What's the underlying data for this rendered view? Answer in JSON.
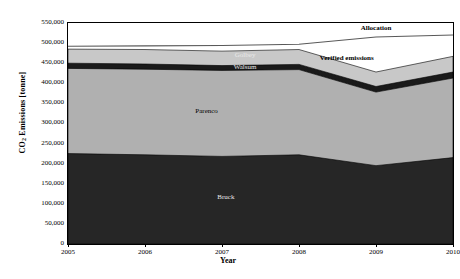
{
  "chart_data": {
    "type": "area",
    "title": "",
    "xlabel": "Year",
    "ylabel": "CO2 Emissions [tonne]",
    "ylabel_parts": {
      "pre": "CO",
      "sub": "2",
      "post": " Emissions [tonne]"
    },
    "x": [
      2005,
      2006,
      2007,
      2008,
      2009,
      2010
    ],
    "xtick_labels": [
      "2005",
      "2006",
      "2007",
      "2008",
      "2009",
      "2010"
    ],
    "xlim": [
      2005,
      2010
    ],
    "ylim": [
      0,
      550000
    ],
    "ytick_values": [
      0,
      50000,
      100000,
      150000,
      200000,
      250000,
      300000,
      350000,
      400000,
      450000,
      500000,
      550000
    ],
    "ytick_labels": [
      "0",
      "50,000",
      "100,000",
      "150,000",
      "200,000",
      "250,000",
      "300,000",
      "350,000",
      "400,000",
      "450,000",
      "500,000",
      "550,000"
    ],
    "grid": false,
    "stacked": true,
    "series": [
      {
        "name": "Bruck",
        "label": "Bruck",
        "color": "#262626",
        "values": [
          225000,
          222000,
          218000,
          222000,
          195000,
          215000
        ]
      },
      {
        "name": "Parenco",
        "label": "Parenco",
        "color": "#b0b0b0",
        "values": [
          212000,
          213000,
          214000,
          212000,
          183000,
          198000
        ]
      },
      {
        "name": "Walsum",
        "label": "Walsum",
        "color": "#1a1a1a",
        "values": [
          13000,
          13000,
          12000,
          13000,
          14000,
          15000
        ]
      },
      {
        "name": "Golbey",
        "label": "Golbey",
        "color": "#c8c8c8",
        "values": [
          35000,
          36000,
          36000,
          37000,
          36000,
          39000
        ]
      }
    ],
    "cumulative_tops": {
      "Bruck": [
        225000,
        222000,
        218000,
        222000,
        195000,
        215000
      ],
      "Parenco": [
        437000,
        435000,
        432000,
        434000,
        378000,
        413000
      ],
      "Walsum": [
        450000,
        448000,
        444000,
        447000,
        392000,
        428000
      ],
      "Golbey": [
        485000,
        484000,
        480000,
        484000,
        428000,
        467000
      ]
    },
    "lines": [
      {
        "name": "Allocation",
        "label": "Allocation",
        "color": "#595959",
        "values": [
          492000,
          493000,
          494000,
          497000,
          515000,
          520000
        ]
      }
    ],
    "annotations": [
      {
        "name": "allocation-annotation",
        "text": "Allocation",
        "x": 2009.0,
        "y": 537000,
        "style": "bold"
      },
      {
        "name": "verified-emissions-annotation",
        "text": "Verified emissions",
        "x": 2008.62,
        "y": 463000,
        "style": "bold"
      },
      {
        "name": "golbey-annotation",
        "text": "Golbey",
        "x": 2007.3,
        "y": 470000,
        "style": "light"
      },
      {
        "name": "walsum-annotation",
        "text": "Walsum",
        "x": 2007.3,
        "y": 441000,
        "style": "light"
      },
      {
        "name": "parenco-annotation",
        "text": "Parenco",
        "x": 2006.8,
        "y": 330000,
        "style": "dark"
      },
      {
        "name": "bruck-annotation",
        "text": "Bruck",
        "x": 2007.05,
        "y": 118000,
        "style": "light"
      }
    ]
  }
}
